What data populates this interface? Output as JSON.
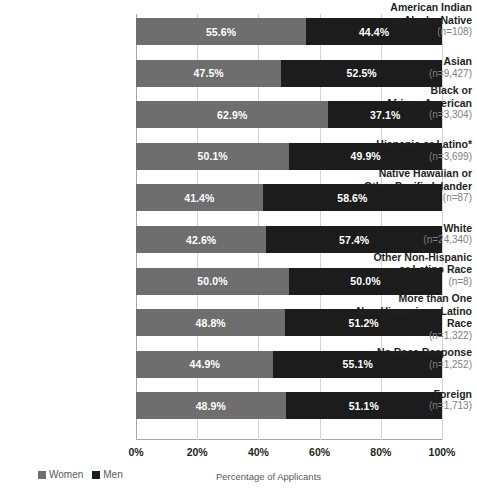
{
  "chart_data": {
    "type": "bar",
    "orientation": "horizontal",
    "stacked": true,
    "stacked_100": true,
    "title": "",
    "xlabel": "Percentage of Applicants",
    "ylabel": "",
    "xlim": [
      0,
      100
    ],
    "xticks": [
      "0%",
      "20%",
      "40%",
      "60%",
      "80%",
      "100%"
    ],
    "xtick_values": [
      0,
      20,
      40,
      60,
      80,
      100
    ],
    "grid": true,
    "grid_axis": "x",
    "legend_position": "bottom-left",
    "categories": [
      "American Indian or Alaska Native",
      "Asian",
      "Black or African American",
      "Hispanic or Latino*",
      "Native Hawaiian or Other Pacific Islander",
      "White",
      "Other Non-Hispanic or Latino Race",
      "More than One Non-Hispanic or Latino Race",
      "No Race Response",
      "Foreign"
    ],
    "series": [
      {
        "name": "Women",
        "color": "#6e6e6e",
        "values": [
          55.6,
          47.5,
          62.9,
          50.1,
          41.4,
          42.6,
          50.0,
          48.8,
          44.9,
          48.9
        ]
      },
      {
        "name": "Men",
        "color": "#1c1c1c",
        "values": [
          44.4,
          52.5,
          37.1,
          49.9,
          58.6,
          57.4,
          50.0,
          51.2,
          55.1,
          51.1
        ]
      }
    ],
    "counts": [
      108,
      9427,
      3304,
      3699,
      87,
      24340,
      8,
      1322,
      1252,
      1713
    ]
  },
  "rows": [
    {
      "label_lines": [
        "American Indian",
        "or Alaska Native"
      ],
      "n_label": "(n=108)",
      "women_value": 55.6,
      "men_value": 44.4,
      "women_label": "55.6%",
      "men_label": "44.4%"
    },
    {
      "label_lines": [
        "Asian"
      ],
      "n_label": "(n=9,427)",
      "women_value": 47.5,
      "men_value": 52.5,
      "women_label": "47.5%",
      "men_label": "52.5%"
    },
    {
      "label_lines": [
        "Black or",
        "African American"
      ],
      "n_label": "(n=3,304)",
      "women_value": 62.9,
      "men_value": 37.1,
      "women_label": "62.9%",
      "men_label": "37.1%"
    },
    {
      "label_lines": [
        "Hispanic or Latino*"
      ],
      "n_label": "(n=3,699)",
      "women_value": 50.1,
      "men_value": 49.9,
      "women_label": "50.1%",
      "men_label": "49.9%"
    },
    {
      "label_lines": [
        "Native Hawaiian or",
        "Other Pacific Islander"
      ],
      "n_label": "(n=87)",
      "women_value": 41.4,
      "men_value": 58.6,
      "women_label": "41.4%",
      "men_label": "58.6%"
    },
    {
      "label_lines": [
        "White"
      ],
      "n_label": "(n=24,340)",
      "women_value": 42.6,
      "men_value": 57.4,
      "women_label": "42.6%",
      "men_label": "57.4%"
    },
    {
      "label_lines": [
        "Other Non-Hispanic",
        "or Latino Race"
      ],
      "n_label": "(n=8)",
      "women_value": 50.0,
      "men_value": 50.0,
      "women_label": "50.0%",
      "men_label": "50.0%"
    },
    {
      "label_lines": [
        "More than One",
        "Non-Hispanic or Latino Race"
      ],
      "n_label": "(n=1,322)",
      "women_value": 48.8,
      "men_value": 51.2,
      "women_label": "48.8%",
      "men_label": "51.2%"
    },
    {
      "label_lines": [
        "No Race Response"
      ],
      "n_label": "(n=1,252)",
      "women_value": 44.9,
      "men_value": 55.1,
      "women_label": "44.9%",
      "men_label": "55.1%"
    },
    {
      "label_lines": [
        "Foreign"
      ],
      "n_label": "(n=1,713)",
      "women_value": 48.9,
      "men_value": 51.1,
      "women_label": "48.9%",
      "men_label": "51.1%"
    }
  ],
  "xaxis": {
    "ticks": [
      "0%",
      "20%",
      "40%",
      "60%",
      "80%",
      "100%"
    ],
    "title": "Percentage of Applicants"
  },
  "legend": {
    "items": [
      {
        "label": "Women",
        "color": "#6e6e6e"
      },
      {
        "label": "Men",
        "color": "#1c1c1c"
      }
    ]
  },
  "colors": {
    "women": "#6e6e6e",
    "men": "#1c1c1c",
    "grid": "#d4d4d4",
    "axis": "#a8a8a8",
    "text": "#231f20",
    "muted_text": "#808080",
    "background": "#ffffff"
  }
}
